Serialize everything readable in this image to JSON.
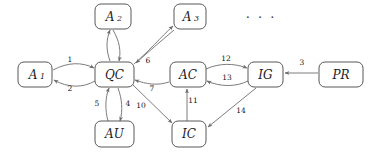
{
  "diagram": {
    "type": "directed-graph",
    "background_color": "#ffffff",
    "node_stroke_color": "#58585a",
    "edge_stroke_color": "#6d6d70",
    "label_color": "#1d1d1f",
    "ellipsis": "· · ·",
    "nodes": [
      {
        "id": "A1",
        "label": "A",
        "subscript": "1",
        "x": 18,
        "y": 62,
        "w": 34,
        "h": 25
      },
      {
        "id": "A2",
        "label": "A",
        "subscript": "2",
        "x": 95,
        "y": 4,
        "w": 36,
        "h": 25
      },
      {
        "id": "A3",
        "label": "A",
        "subscript": "3",
        "x": 174,
        "y": 4,
        "w": 32,
        "h": 25
      },
      {
        "id": "QC",
        "label": "QC",
        "subscript": "",
        "x": 95,
        "y": 62,
        "w": 39,
        "h": 25
      },
      {
        "id": "AU",
        "label": "AU",
        "subscript": "",
        "x": 95,
        "y": 121,
        "w": 39,
        "h": 26
      },
      {
        "id": "AC",
        "label": "AC",
        "subscript": "",
        "x": 170,
        "y": 62,
        "w": 36,
        "h": 25
      },
      {
        "id": "IC",
        "label": "IC",
        "subscript": "",
        "x": 172,
        "y": 121,
        "w": 34,
        "h": 26
      },
      {
        "id": "IG",
        "label": "IG",
        "subscript": "",
        "x": 248,
        "y": 62,
        "w": 35,
        "h": 25
      },
      {
        "id": "PR",
        "label": "PR",
        "subscript": "",
        "x": 319,
        "y": 62,
        "w": 44,
        "h": 25
      }
    ],
    "edges": [
      {
        "id": "e1",
        "from": "A1",
        "to": "QC",
        "label": "1",
        "label_x": 70,
        "label_y": 60
      },
      {
        "id": "e2",
        "from": "QC",
        "to": "A1",
        "label": "2",
        "label_x": 70,
        "label_y": 89
      },
      {
        "id": "e3",
        "from": "PR",
        "to": "IG",
        "label": "3",
        "label_x": 302,
        "label_y": 63
      },
      {
        "id": "e4",
        "from": "QC",
        "to": "AU",
        "label": "4",
        "label_x": 128,
        "label_y": 104
      },
      {
        "id": "e5",
        "from": "AU",
        "to": "QC",
        "label": "5",
        "label_x": 97,
        "label_y": 104
      },
      {
        "id": "e6",
        "from": "A3",
        "to": "QC",
        "label": "6",
        "label_x": 148,
        "label_y": 61
      },
      {
        "id": "e7",
        "from": "AC",
        "to": "QC",
        "label": "7",
        "label_x": 152,
        "label_y": 89
      },
      {
        "id": "e8",
        "from": "QC",
        "to": "A2",
        "label": "",
        "label_x": 0,
        "label_y": 0
      },
      {
        "id": "e9",
        "from": "QC",
        "to": "A3",
        "label": "",
        "label_x": 0,
        "label_y": 0
      },
      {
        "id": "e10",
        "from": "QC",
        "to": "IC",
        "label": "10",
        "label_x": 141,
        "label_y": 106
      },
      {
        "id": "e11",
        "from": "IC",
        "to": "AC",
        "label": "11",
        "label_x": 193,
        "label_y": 101
      },
      {
        "id": "e12",
        "from": "AC",
        "to": "IG",
        "label": "12",
        "label_x": 226,
        "label_y": 59
      },
      {
        "id": "e13",
        "from": "IG",
        "to": "AC",
        "label": "13",
        "label_x": 227,
        "label_y": 78
      },
      {
        "id": "e14",
        "from": "IG",
        "to": "IC",
        "label": "14",
        "label_x": 241,
        "label_y": 111
      }
    ]
  }
}
